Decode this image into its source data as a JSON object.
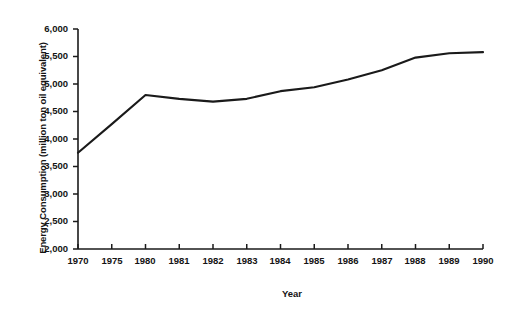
{
  "chart_data": {
    "type": "line",
    "title": "",
    "xlabel": "Year",
    "ylabel": "Energy Consumption (million ton oil equivalent)",
    "x": [
      1970,
      1975,
      1980,
      1981,
      1982,
      1983,
      1984,
      1985,
      1986,
      1987,
      1988,
      1989,
      1990
    ],
    "categories": [
      "1970",
      "1975",
      "1980",
      "1981",
      "1982",
      "1983",
      "1984",
      "1985",
      "1986",
      "1987",
      "1988",
      "1989",
      "1990"
    ],
    "values": [
      3750,
      4270,
      4800,
      4730,
      4680,
      4730,
      4870,
      4940,
      5080,
      5250,
      5480,
      5560,
      5580
    ],
    "series": [
      {
        "name": "Energy Consumption",
        "values": [
          3750,
          4270,
          4800,
          4730,
          4680,
          4730,
          4870,
          4940,
          5080,
          5250,
          5480,
          5560,
          5580
        ]
      }
    ],
    "xlim": [
      1970,
      1990
    ],
    "ylim": [
      2000,
      6000
    ],
    "ytick_values": [
      2000,
      2500,
      3000,
      3500,
      4000,
      4500,
      5000,
      5500,
      6000
    ],
    "ytick_labels": [
      "2,000",
      "2,500",
      "3,000",
      "3,500",
      "4,000",
      "4,500",
      "5,000",
      "5,500",
      "6,000"
    ],
    "xtick_labels": [
      "1970",
      "1975",
      "1980",
      "1981",
      "1982",
      "1983",
      "1984",
      "1985",
      "1986",
      "1987",
      "1988",
      "1989",
      "1990"
    ],
    "grid": false,
    "legend": "none",
    "line_color": "#1a1a1a",
    "axis_color": "#1a1a1a",
    "background_color": "#ffffff"
  },
  "axis": {
    "ylabel": "Energy Consumption (million ton oil equivalent)",
    "xlabel": "Year",
    "yticks": [
      {
        "label": "6,000"
      },
      {
        "label": "5,500"
      },
      {
        "label": "5,000"
      },
      {
        "label": "4,500"
      },
      {
        "label": "4,000"
      },
      {
        "label": "3,500"
      },
      {
        "label": "3,000"
      },
      {
        "label": "2,500"
      },
      {
        "label": "2,000"
      }
    ],
    "xticks": [
      {
        "label": "1970"
      },
      {
        "label": "1975"
      },
      {
        "label": "1980"
      },
      {
        "label": "1981"
      },
      {
        "label": "1982"
      },
      {
        "label": "1983"
      },
      {
        "label": "1984"
      },
      {
        "label": "1985"
      },
      {
        "label": "1986"
      },
      {
        "label": "1987"
      },
      {
        "label": "1988"
      },
      {
        "label": "1989"
      },
      {
        "label": "1990"
      }
    ]
  }
}
